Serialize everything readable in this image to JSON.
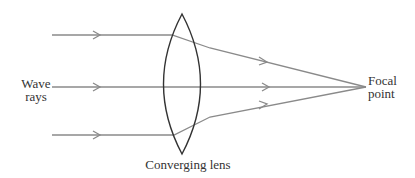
{
  "diagram": {
    "labels": {
      "wave_rays_line1": "Wave",
      "wave_rays_line2": "rays",
      "lens": "Converging lens",
      "focal_line1": "Focal",
      "focal_line2": "point"
    },
    "colors": {
      "ray": "#8a8a8a",
      "lens": "#333333",
      "text": "#333333"
    },
    "rays": [
      {
        "name": "upper-ray",
        "y": 35
      },
      {
        "name": "middle-ray",
        "y": 87
      },
      {
        "name": "lower-ray",
        "y": 135
      }
    ],
    "focal_point": {
      "x": 366,
      "y": 87
    }
  }
}
